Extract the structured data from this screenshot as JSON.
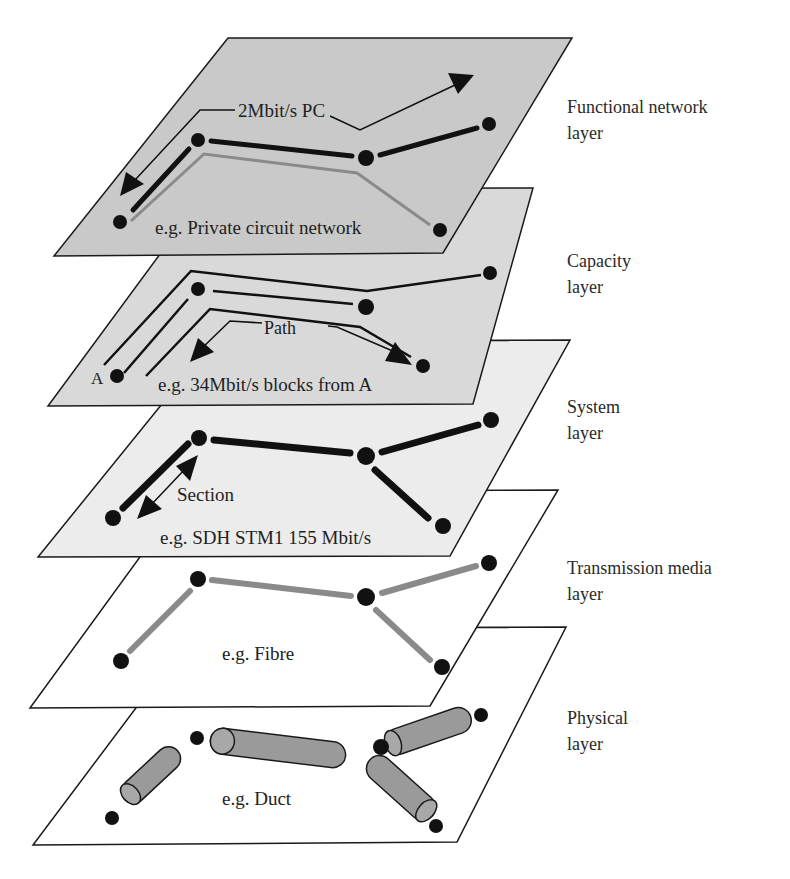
{
  "header_fragment": "Overview of ",
  "layers": [
    {
      "id": "functional",
      "name_line1": "Functional network",
      "name_line2": "layer",
      "example": "e.g. Private circuit network",
      "annotation": "2Mbit/s PC",
      "fill": "#c9c9c9"
    },
    {
      "id": "capacity",
      "name_line1": "Capacity",
      "name_line2": "layer",
      "example": "e.g. 34Mbit/s blocks from A",
      "annotation": "Path",
      "node_label": "A",
      "fill": "#d9d9d9"
    },
    {
      "id": "system",
      "name_line1": "System",
      "name_line2": "layer",
      "example": "e.g. SDH STM1 155 Mbit/s",
      "annotation": "Section",
      "fill": "#ececec"
    },
    {
      "id": "transmission",
      "name_line1": "Transmission media",
      "name_line2": "layer",
      "example": "e.g. Fibre",
      "fill": "#ffffff"
    },
    {
      "id": "physical",
      "name_line1": "Physical",
      "name_line2": "layer",
      "example": "e.g. Duct",
      "fill": "#ffffff"
    }
  ],
  "colors": {
    "node": "#111111",
    "black_link": "#111111",
    "grey_link": "#8a8a8a",
    "duct_fill": "#9a9a9a",
    "outline": "#1a1a1a"
  }
}
